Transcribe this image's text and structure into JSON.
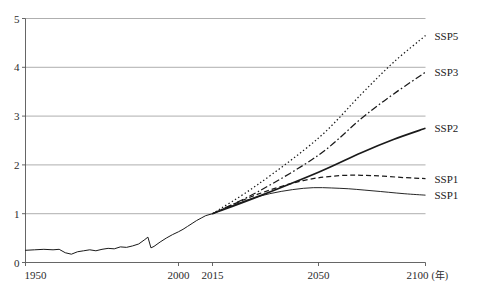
{
  "chart_data": {
    "type": "line",
    "title": "",
    "xlabel": "年",
    "ylabel": "",
    "xlim": [
      1950,
      2100
    ],
    "ylim": [
      0,
      5
    ],
    "grid": true,
    "legend_position": "right-of-line-end",
    "x_ticks": [
      "1950",
      "2000",
      "2015",
      "2050",
      "2100"
    ],
    "x_tick_values": [
      1950,
      2000,
      2015,
      2050,
      2100
    ],
    "y_ticks": [
      "0",
      "1",
      "2",
      "3",
      "4",
      "5"
    ],
    "y_tick_values": [
      0,
      1,
      2,
      3,
      4,
      5
    ],
    "x_unit_note": "(年)",
    "historical": {
      "name": "historical",
      "style": "solid-thin",
      "x": [
        1950,
        1953,
        1956,
        1959,
        1961,
        1963,
        1965,
        1967,
        1969,
        1971,
        1973,
        1975,
        1977,
        1979,
        1981,
        1983,
        1985,
        1987,
        1989,
        1990,
        1991,
        1992,
        1994,
        1996,
        1998,
        2000,
        2002,
        2004,
        2006,
        2008,
        2010,
        2012,
        2015
      ],
      "y": [
        0.25,
        0.26,
        0.27,
        0.26,
        0.27,
        0.2,
        0.17,
        0.22,
        0.24,
        0.26,
        0.24,
        0.27,
        0.29,
        0.28,
        0.32,
        0.31,
        0.34,
        0.38,
        0.47,
        0.52,
        0.3,
        0.33,
        0.42,
        0.5,
        0.57,
        0.63,
        0.68,
        0.74,
        0.8,
        0.86,
        0.91,
        0.96,
        1.0
      ]
    },
    "series": [
      {
        "name": "SSP5",
        "label": "SSP5",
        "style": "dotted",
        "x": [
          2015,
          2030,
          2050,
          2070,
          2085,
          2100
        ],
        "y": [
          1.0,
          1.6,
          2.55,
          3.45,
          4.1,
          4.65
        ],
        "end_value": 4.65
      },
      {
        "name": "SSP3",
        "label": "SSP3",
        "style": "dash-dot",
        "x": [
          2015,
          2030,
          2050,
          2070,
          2085,
          2100
        ],
        "y": [
          1.0,
          1.45,
          2.2,
          2.95,
          3.45,
          3.9
        ],
        "end_value": 3.9
      },
      {
        "name": "SSP2",
        "label": "SSP2",
        "style": "solid-thick",
        "x": [
          2015,
          2030,
          2050,
          2070,
          2085,
          2100
        ],
        "y": [
          1.0,
          1.35,
          1.85,
          2.25,
          2.52,
          2.75
        ],
        "end_value": 2.75
      },
      {
        "name": "SSP1-dashed",
        "label": "SSP1",
        "style": "dashed",
        "x": [
          2015,
          2030,
          2045,
          2060,
          2075,
          2090,
          2100
        ],
        "y": [
          1.0,
          1.4,
          1.68,
          1.78,
          1.78,
          1.74,
          1.72
        ],
        "end_value": 1.72,
        "peak_value": 1.78
      },
      {
        "name": "SSP1-solid",
        "label": "SSP1",
        "style": "solid-thin",
        "x": [
          2015,
          2030,
          2045,
          2060,
          2075,
          2090,
          2100
        ],
        "y": [
          1.0,
          1.35,
          1.52,
          1.52,
          1.47,
          1.41,
          1.38
        ],
        "end_value": 1.38,
        "peak_value": 1.53
      }
    ]
  },
  "cropped_header": "",
  "axis": {
    "x_unit": "(年)"
  }
}
